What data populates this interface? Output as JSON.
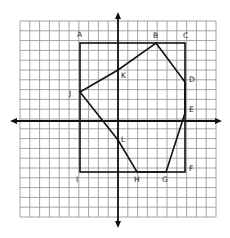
{
  "diagram": {
    "type": "coordinate-grid-geometry",
    "grid": {
      "cells_x": 20,
      "cells_y": 20,
      "cell_units": 1
    },
    "axes": {
      "x_axis": "horizontal with arrows",
      "y_axis": "vertical with arrows"
    },
    "rectangle": {
      "label": "Rectangle ACFI",
      "vertices": [
        {
          "name": "A",
          "x": -4,
          "y": 8
        },
        {
          "name": "C",
          "x": 7,
          "y": 8
        },
        {
          "name": "F",
          "x": 7,
          "y": -5
        },
        {
          "name": "I",
          "x": -4,
          "y": -5
        }
      ]
    },
    "polygon": {
      "label": "Polygon BDEGHLJK",
      "vertices": [
        {
          "name": "B",
          "x": 4,
          "y": 8
        },
        {
          "name": "D",
          "x": 7,
          "y": 4
        },
        {
          "name": "E",
          "x": 7,
          "y": 1
        },
        {
          "name": "G",
          "x": 5,
          "y": -5
        },
        {
          "name": "H",
          "x": 2,
          "y": -5
        },
        {
          "name": "L",
          "x": 0,
          "y": -2
        },
        {
          "name": "J",
          "x": -4,
          "y": 3
        },
        {
          "name": "K",
          "x": 0,
          "y": 5
        }
      ]
    },
    "labels": {
      "A": "A",
      "B": "B",
      "C": "C",
      "D": "D",
      "E": "E",
      "F": "F",
      "G": "G",
      "H": "H",
      "I": "I",
      "J": "J",
      "K": "K",
      "L": "L"
    },
    "colors": {
      "grid": "#9a9a9a",
      "lines": "#111111",
      "background": "#ffffff"
    }
  }
}
